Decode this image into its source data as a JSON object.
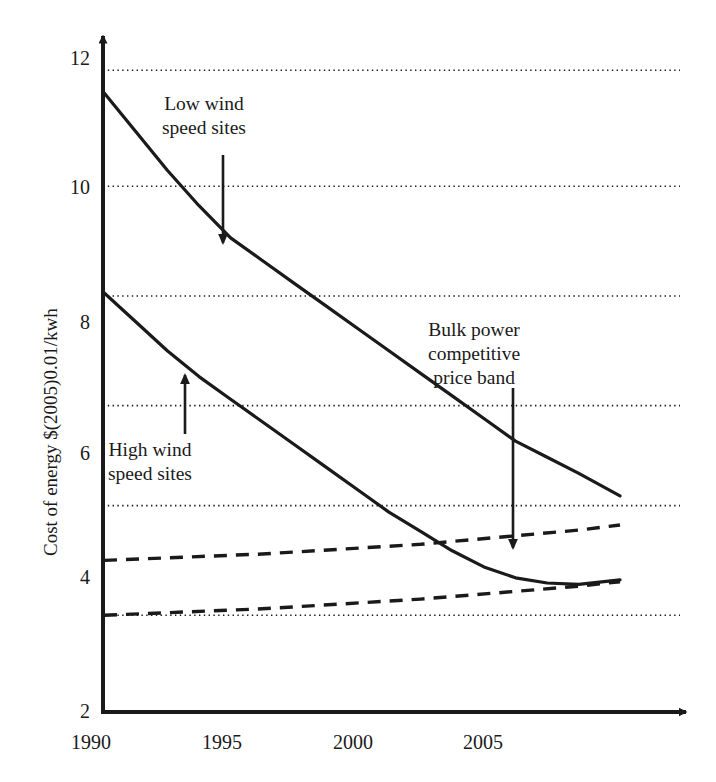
{
  "figure": {
    "name": "wind-energy-cost-of-energy-chart",
    "background_color": "#ffffff",
    "ink_color": "#1a1a1a"
  },
  "axes": {
    "y_axis_title": "Cost of energy $(2005)0.01/kwh",
    "x_axis_title": "",
    "y_ticks": [
      "2",
      "4",
      "6",
      "8",
      "10",
      "12"
    ],
    "x_ticks": [
      "1990",
      "1995",
      "2000",
      "2005"
    ]
  },
  "annotations": [
    {
      "name": "low-wind-speed-sites",
      "line1": "Low wind",
      "line2": "speed sites",
      "arrow": "down-arrow-icon"
    },
    {
      "name": "high-wind-speed-sites",
      "line1": "High wind",
      "line2": "speed sites",
      "arrow": "up-arrow-icon"
    },
    {
      "name": "bulk-power-competitive-price-band",
      "line1": "Bulk power",
      "line2": "competitive",
      "line3": "price band",
      "arrow": "down-arrow-icon"
    }
  ],
  "chart_data": {
    "type": "line",
    "title": "",
    "xlabel": "",
    "ylabel": "Cost of energy $(2005)0.01/kwh",
    "xlim": [
      1990,
      2006.3
    ],
    "ylim": [
      2,
      12.45
    ],
    "xticks": [
      1990,
      1995,
      2000,
      2005
    ],
    "yticks": [
      2,
      4,
      6,
      8,
      10,
      12
    ],
    "grid": "horizontal-dotted",
    "gridlines_y": [
      3.5,
      5.2,
      6.75,
      8.45,
      10.15,
      11.95
    ],
    "legend": "none (inline annotations with arrows)",
    "series": [
      {
        "name": "Low wind speed sites",
        "style": "solid",
        "x": [
          1990,
          1991,
          1992,
          1993,
          1994,
          1995,
          1996,
          1997,
          1998,
          1999,
          2000,
          2001,
          2002,
          2003,
          2004,
          2005,
          2006.3
        ],
        "values": [
          11.6,
          11.0,
          10.4,
          9.85,
          9.35,
          9.0,
          8.65,
          8.3,
          7.95,
          7.6,
          7.25,
          6.9,
          6.55,
          6.2,
          5.95,
          5.7,
          5.35
        ]
      },
      {
        "name": "High wind speed sites",
        "style": "solid",
        "x": [
          1990,
          1991,
          1992,
          1993,
          1994,
          1995,
          1996,
          1997,
          1998,
          1999,
          2000,
          2001,
          2002,
          2003,
          2004,
          2005,
          2006.3
        ],
        "values": [
          8.5,
          8.05,
          7.6,
          7.2,
          6.85,
          6.5,
          6.15,
          5.8,
          5.45,
          5.1,
          4.8,
          4.5,
          4.25,
          4.08,
          4.0,
          3.98,
          4.05
        ]
      },
      {
        "name": "Bulk power competitive price band - upper bound",
        "style": "dashed",
        "x": [
          1990,
          1995,
          2000,
          2005,
          2006.3
        ],
        "values": [
          4.35,
          4.45,
          4.6,
          4.82,
          4.9
        ]
      },
      {
        "name": "Bulk power competitive price band - lower bound",
        "style": "dashed",
        "x": [
          1990,
          1995,
          2000,
          2005,
          2006.3
        ],
        "values": [
          3.5,
          3.6,
          3.75,
          3.95,
          4.02
        ]
      }
    ]
  }
}
